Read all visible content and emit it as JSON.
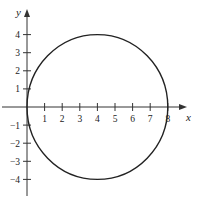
{
  "chart_data": {
    "type": "line",
    "title": "",
    "xlabel": "x",
    "ylabel": "y",
    "xlim": [
      -0.5,
      8.8
    ],
    "ylim": [
      -4.8,
      4.8
    ],
    "x_ticks": [
      1,
      2,
      3,
      4,
      5,
      6,
      7,
      8
    ],
    "y_ticks": [
      -4,
      -3,
      -2,
      -1,
      1,
      2,
      3,
      4
    ],
    "grid": false,
    "legend": null,
    "series": [
      {
        "name": "circle",
        "shape": "circle",
        "center": [
          4,
          0
        ],
        "radius": 4,
        "equation": "(x-4)^2 + y^2 = 16",
        "color": "#222222"
      }
    ]
  },
  "colors": {
    "axis": "#333333",
    "curve": "#222222",
    "text": "#222222"
  }
}
